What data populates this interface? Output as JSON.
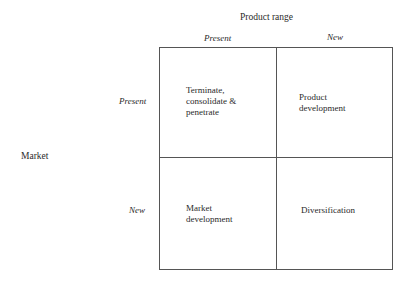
{
  "diagram": {
    "type": "2x2-matrix",
    "x_axis": {
      "title": "Product range",
      "columns": [
        "Present",
        "New"
      ]
    },
    "y_axis": {
      "title": "Market",
      "rows": [
        "Present",
        "New"
      ]
    },
    "cells": [
      {
        "row": "Present",
        "column": "Present",
        "label": "Terminate,\nconsolidate &\npenetrate"
      },
      {
        "row": "Present",
        "column": "New",
        "label": "Product\ndevelopment"
      },
      {
        "row": "New",
        "column": "Present",
        "label": "Market\ndevelopment"
      },
      {
        "row": "New",
        "column": "New",
        "label": "Diversification"
      }
    ]
  }
}
